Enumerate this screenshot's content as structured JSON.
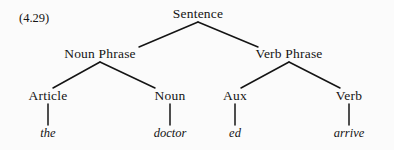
{
  "figure": {
    "equation_label": "(4.29)",
    "background_color": "#fbfbfb",
    "line_color": "#141414",
    "text_color": "#141414"
  },
  "tree": {
    "root": {
      "label": "Sentence",
      "x": 198,
      "y": 14
    },
    "phrases": [
      {
        "label": "Noun Phrase",
        "x": 100,
        "y": 54
      },
      {
        "label": "Verb Phrase",
        "x": 289,
        "y": 54
      }
    ],
    "categories": [
      {
        "label": "Article",
        "x": 48,
        "y": 96
      },
      {
        "label": "Noun",
        "x": 170,
        "y": 96
      },
      {
        "label": "Aux",
        "x": 235,
        "y": 96
      },
      {
        "label": "Verb",
        "x": 349,
        "y": 96
      }
    ],
    "words": [
      {
        "label": "the",
        "x": 48,
        "y": 133
      },
      {
        "label": "doctor",
        "x": 170,
        "y": 133
      },
      {
        "label": "ed",
        "x": 235,
        "y": 133
      },
      {
        "label": "arrive",
        "x": 349,
        "y": 133
      }
    ],
    "edges": [
      {
        "name": "sentence-to-noun-phrase",
        "x1": 198,
        "y1": 22,
        "x2": 139,
        "y2": 47
      },
      {
        "name": "sentence-to-verb-phrase",
        "x1": 198,
        "y1": 22,
        "x2": 258,
        "y2": 47
      },
      {
        "name": "noun-phrase-to-article",
        "x1": 100,
        "y1": 62,
        "x2": 53,
        "y2": 88
      },
      {
        "name": "noun-phrase-to-noun",
        "x1": 100,
        "y1": 62,
        "x2": 155,
        "y2": 88
      },
      {
        "name": "verb-phrase-to-aux",
        "x1": 289,
        "y1": 62,
        "x2": 241,
        "y2": 88
      },
      {
        "name": "verb-phrase-to-verb",
        "x1": 289,
        "y1": 62,
        "x2": 340,
        "y2": 88
      },
      {
        "name": "article-to-the",
        "x1": 48,
        "y1": 104,
        "x2": 48,
        "y2": 125
      },
      {
        "name": "noun-to-doctor",
        "x1": 170,
        "y1": 104,
        "x2": 170,
        "y2": 125
      },
      {
        "name": "aux-to-ed",
        "x1": 235,
        "y1": 104,
        "x2": 235,
        "y2": 125
      },
      {
        "name": "verb-to-arrive",
        "x1": 349,
        "y1": 104,
        "x2": 349,
        "y2": 125
      }
    ]
  }
}
